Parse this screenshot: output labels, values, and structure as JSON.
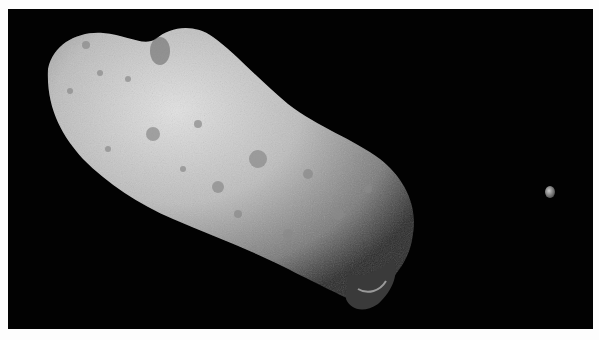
{
  "image": {
    "subject": "asteroid with small moon against black space",
    "background_color": "#020202",
    "margin_color": "#fdfdfd",
    "asteroid_color": "#c8c8c8",
    "moon_color": "#a8a8a8"
  }
}
